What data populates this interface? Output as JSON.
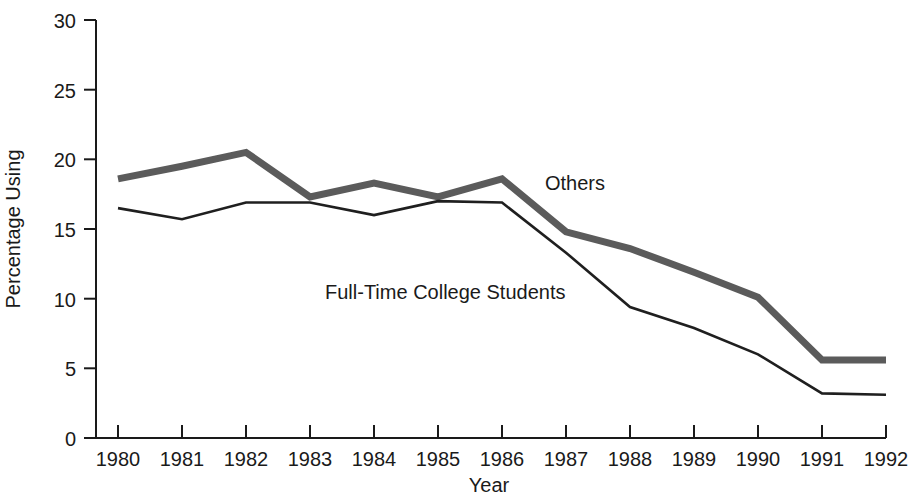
{
  "chart_data": {
    "type": "line",
    "title": "",
    "xlabel": "Year",
    "ylabel": "Percentage Using",
    "categories": [
      1980,
      1981,
      1982,
      1983,
      1984,
      1985,
      1986,
      1987,
      1988,
      1989,
      1990,
      1991,
      1992
    ],
    "x_tick_labels": [
      "1980",
      "1981",
      "1982",
      "1983",
      "1984",
      "1985",
      "1986",
      "1987",
      "1988",
      "1989",
      "1990",
      "1991",
      "1992"
    ],
    "y_tick_labels": [
      "0",
      "5",
      "10",
      "15",
      "20",
      "25",
      "30"
    ],
    "y_ticks": [
      0,
      5,
      10,
      15,
      20,
      25,
      30
    ],
    "ylim": [
      0,
      30
    ],
    "xlim": [
      1980,
      1992
    ],
    "grid": false,
    "legend_position": "inline-annotations",
    "series": [
      {
        "name": "Others",
        "color": "#5b5b5b",
        "style": "thick-gray-line",
        "values": [
          18.6,
          19.5,
          20.5,
          17.3,
          18.3,
          17.3,
          18.6,
          14.8,
          13.6,
          11.9,
          10.1,
          5.6,
          5.6
        ]
      },
      {
        "name": "Full-Time College Students",
        "color": "#1f1f1f",
        "style": "thin-black-line",
        "values": [
          16.5,
          15.7,
          16.9,
          16.9,
          16.0,
          17.0,
          16.9,
          13.3,
          9.4,
          7.9,
          6.0,
          3.2,
          3.1
        ]
      }
    ],
    "annotations": [
      {
        "text": "Others",
        "series": "Others",
        "x_px": 545,
        "y_px": 190
      },
      {
        "text": "Full-Time College Students",
        "series": "Full-Time College Students",
        "x_px": 325,
        "y_px": 299
      }
    ]
  }
}
